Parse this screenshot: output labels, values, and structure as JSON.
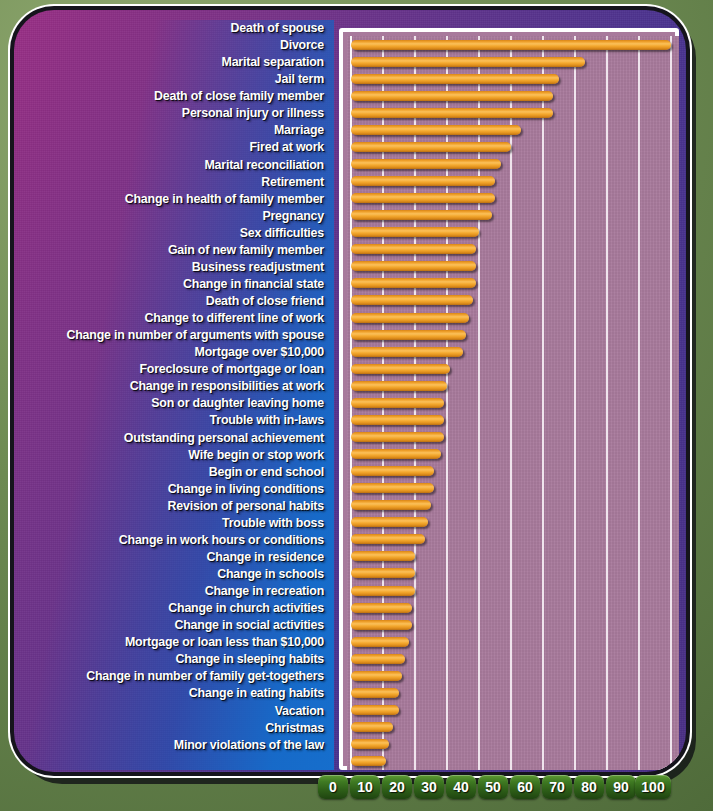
{
  "chart_data": {
    "type": "bar",
    "orientation": "horizontal",
    "xlabel": "",
    "ylabel": "",
    "xlim": [
      0,
      100
    ],
    "grid": true,
    "legend": "none",
    "bar_color": "#f0a22c",
    "plot_bg": "#a97b9d",
    "gridline_color": "#ffffff",
    "axis_tick_color": "#3f7a22",
    "xticks": [
      0,
      10,
      20,
      30,
      40,
      50,
      60,
      70,
      80,
      90,
      100
    ],
    "categories": [
      "Death of spouse",
      "Divorce",
      "Marital separation",
      "Jail term",
      "Death of close family member",
      "Personal injury or illness",
      "Marriage",
      "Fired at work",
      "Marital reconciliation",
      "Retirement",
      "Change in health of family member",
      "Pregnancy",
      "Sex difficulties",
      "Gain of new family member",
      "Business readjustment",
      "Change in financial state",
      "Death of close friend",
      "Change to different line of work",
      "Change in number of arguments with spouse",
      "Mortgage over $10,000",
      "Foreclosure of mortgage or loan",
      "Change in responsibilities at work",
      "Son or daughter leaving home",
      "Trouble with in-laws",
      "Outstanding personal achievement",
      "Wife begin or stop work",
      "Begin or end school",
      "Change in living conditions",
      "Revision of personal habits",
      "Trouble with boss",
      "Change in work hours or conditions",
      "Change in residence",
      "Change in schools",
      "Change in recreation",
      "Change in church activities",
      "Change in social activities",
      "Mortgage or loan less than $10,000",
      "Change in sleeping habits",
      "Change in number of family get-togethers",
      "Change in eating habits",
      "Vacation",
      "Christmas",
      "Minor violations of the law"
    ],
    "values": [
      100,
      73,
      65,
      63,
      63,
      53,
      50,
      47,
      45,
      45,
      44,
      40,
      39,
      39,
      39,
      38,
      37,
      36,
      35,
      31,
      30,
      29,
      29,
      29,
      28,
      26,
      26,
      25,
      24,
      23,
      20,
      20,
      20,
      19,
      19,
      18,
      17,
      16,
      15,
      15,
      13,
      12,
      11
    ]
  },
  "axis": {
    "labels": [
      "0",
      "10",
      "20",
      "30",
      "40",
      "50",
      "60",
      "70",
      "80",
      "90",
      "100"
    ]
  }
}
